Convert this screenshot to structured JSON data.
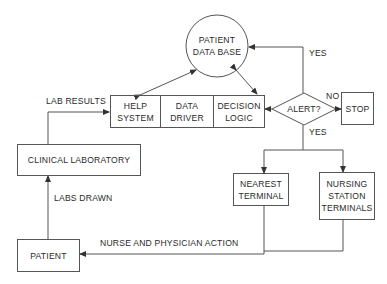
{
  "diagram": {
    "nodes": {
      "patient_db": {
        "label": "PATIENT\nDATA BASE",
        "shape": "circle"
      },
      "help_system": {
        "label": "HELP\nSYSTEM",
        "shape": "box"
      },
      "data_driver": {
        "label": "DATA\nDRIVER",
        "shape": "box"
      },
      "decision_logic": {
        "label": "DECISION\nLOGIC",
        "shape": "box"
      },
      "alert": {
        "label": "ALERT?",
        "shape": "diamond"
      },
      "stop": {
        "label": "STOP",
        "shape": "box"
      },
      "nearest_terminal": {
        "label": "NEAREST\nTERMINAL",
        "shape": "box"
      },
      "nursing_terminals": {
        "label": "NURSING\nSTATION\nTERMINALS",
        "shape": "box"
      },
      "clinical_lab": {
        "label": "CLINICAL LABORATORY",
        "shape": "box"
      },
      "patient": {
        "label": "PATIENT",
        "shape": "box"
      }
    },
    "edge_labels": {
      "yes_top": "YES",
      "no": "NO",
      "yes_bottom": "YES",
      "lab_results": "LAB RESULTS",
      "labs_drawn": "LABS DRAWN",
      "nurse_action": "NURSE AND PHYSICIAN ACTION"
    },
    "edges": [
      {
        "from": "help_system",
        "to": "patient_db",
        "bidirectional": true
      },
      {
        "from": "decision_logic",
        "to": "patient_db",
        "bidirectional": true
      },
      {
        "from": "alert",
        "to": "decision_logic"
      },
      {
        "from": "alert",
        "to": "patient_db",
        "label": "YES"
      },
      {
        "from": "alert",
        "to": "stop",
        "label": "NO"
      },
      {
        "from": "alert",
        "to": "nearest_terminal",
        "label": "YES"
      },
      {
        "from": "alert",
        "to": "nursing_terminals",
        "label": "YES"
      },
      {
        "from": "nearest_terminal",
        "to": "patient",
        "label": "NURSE AND PHYSICIAN ACTION"
      },
      {
        "from": "nursing_terminals",
        "to": "patient"
      },
      {
        "from": "patient",
        "to": "clinical_lab",
        "label": "LABS DRAWN"
      },
      {
        "from": "clinical_lab",
        "to": "help_system",
        "label": "LAB RESULTS"
      }
    ],
    "colors": {
      "line": "#555555",
      "text": "#2a2a2a",
      "background": "#ffffff"
    }
  }
}
